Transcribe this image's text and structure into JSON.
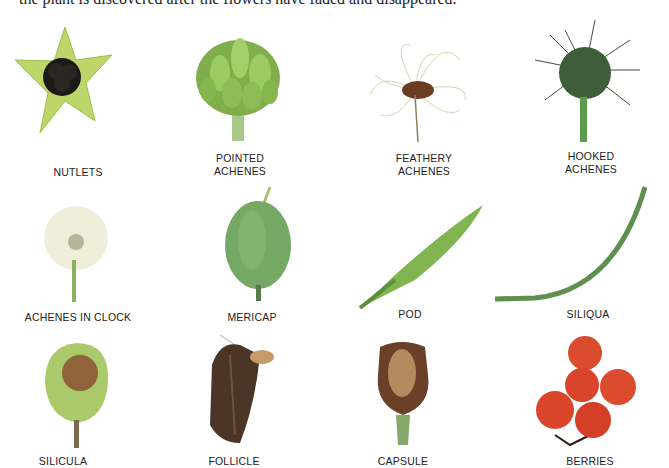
{
  "intro_text": "the plant is discovered after the flowers have faded and disappeared.",
  "fruits": [
    {
      "id": "nutlets",
      "label": "NUTLETS"
    },
    {
      "id": "pointed-achenes",
      "label_line1": "POINTED",
      "label_line2": "ACHENES"
    },
    {
      "id": "feathery-achenes",
      "label_line1": "FEATHERY",
      "label_line2": "ACHENES"
    },
    {
      "id": "hooked-achenes",
      "label_line1": "HOOKED",
      "label_line2": "ACHENES"
    },
    {
      "id": "achenes-in-clock",
      "label": "ACHENES IN CLOCK"
    },
    {
      "id": "mericap",
      "label": "MERICAP"
    },
    {
      "id": "pod",
      "label": "POD"
    },
    {
      "id": "siliqua",
      "label": "SILIQUA"
    },
    {
      "id": "silicula",
      "label": "SILICULA"
    },
    {
      "id": "follicle",
      "label": "FOLLICLE"
    },
    {
      "id": "capsule",
      "label": "CAPSULE"
    },
    {
      "id": "berries",
      "label": "BERRIES"
    }
  ],
  "colors": {
    "leaf_green": "#8fb84a",
    "dark_green": "#3d6b35",
    "berry_red": "#d9442a",
    "brown": "#4a3020"
  }
}
